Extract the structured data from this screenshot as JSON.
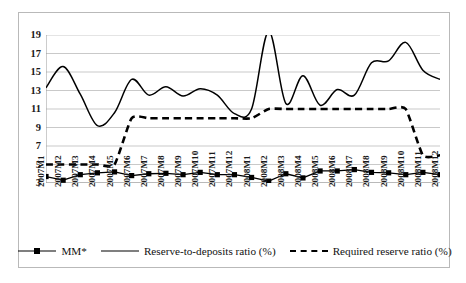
{
  "chart_data": {
    "type": "line",
    "title": "",
    "subtitle": "",
    "xlabel": "",
    "ylabel": "",
    "ylim": [
      3,
      19
    ],
    "y_ticks": [
      3,
      5,
      7,
      9,
      11,
      13,
      15,
      17,
      19
    ],
    "grid": "horizontal",
    "legend_position": "bottom",
    "categories": [
      "2007M1",
      "2007M2",
      "2007M3",
      "2007M4",
      "2007M5",
      "2007M6",
      "2007M7",
      "2007M8",
      "2007M9",
      "2007M10",
      "2007M11",
      "2007M12",
      "2008M1",
      "2008M2",
      "2008M3",
      "2008M4",
      "2008M5",
      "2008M6",
      "2008M7",
      "2008M8",
      "2008M9",
      "2008M10",
      "2008M11",
      "2008M12"
    ],
    "series": [
      {
        "name": "MM*",
        "style": "solid-with-square-markers",
        "color": "#000000",
        "values": [
          3.7,
          3.3,
          3.9,
          4.1,
          4.2,
          3.8,
          4.0,
          4.05,
          3.9,
          4.15,
          3.9,
          3.9,
          3.6,
          3.2,
          4.0,
          3.55,
          4.3,
          4.3,
          4.45,
          4.15,
          4.1,
          3.9,
          4.15,
          3.9
        ]
      },
      {
        "name": "Reserve-to-deposits ratio (%)",
        "style": "solid",
        "color": "#000000",
        "values": [
          13.3,
          15.6,
          12.6,
          9.2,
          10.6,
          14.2,
          12.5,
          13.4,
          12.4,
          13.2,
          12.5,
          10.5,
          11.0,
          19.4,
          11.6,
          14.6,
          11.4,
          13.1,
          12.5,
          16.0,
          16.2,
          18.2,
          15.2,
          14.2
        ]
      },
      {
        "name": "Required reserve ratio (%)",
        "style": "dashed",
        "color": "#000000",
        "values": [
          5,
          5,
          5,
          5,
          5,
          10,
          10,
          10,
          10,
          10,
          10,
          10,
          10,
          11,
          11,
          11,
          11,
          11,
          11,
          11,
          11,
          11,
          6,
          6
        ]
      }
    ],
    "legend": [
      {
        "label": "MM*",
        "marker": "square",
        "line": "solid"
      },
      {
        "label": "Reserve-to-deposits ratio (%)",
        "marker": "none",
        "line": "solid"
      },
      {
        "label": "Required reserve ratio (%)",
        "marker": "none",
        "line": "dashed"
      }
    ],
    "colors": {
      "line": "#000000",
      "grid": "#c9c9c9",
      "frame": "#b9b9b9",
      "background": "#ffffff"
    }
  }
}
